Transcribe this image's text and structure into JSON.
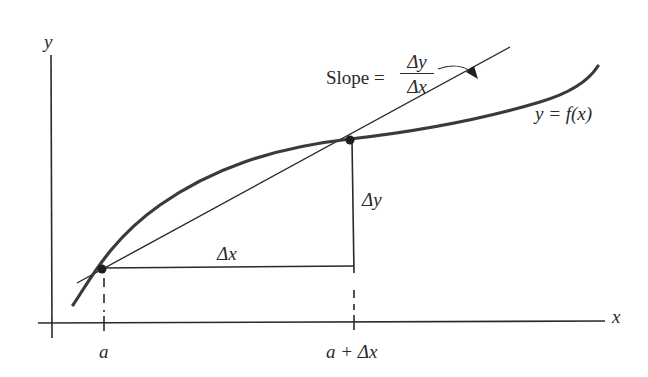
{
  "diagram": {
    "type": "secant-slope-illustration",
    "axes": {
      "x_label": "x",
      "y_label": "y"
    },
    "curve_label": "y = f(x)",
    "slope_label": {
      "prefix": "Slope =",
      "numerator": "Δy",
      "denominator": "Δx"
    },
    "delta_x_label": "Δx",
    "delta_y_label": "Δy",
    "ticks": [
      {
        "label": "a"
      },
      {
        "label": "a + Δx"
      }
    ],
    "points": [
      {
        "name": "(a, f(a))"
      },
      {
        "name": "(a + Δx, f(a + Δx))"
      }
    ],
    "colors": {
      "curve": "#3a3a3a",
      "lines": "#2a2a2a",
      "background": "#ffffff"
    }
  }
}
